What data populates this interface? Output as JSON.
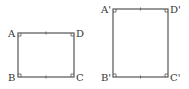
{
  "rect1": {
    "labels": {
      "A": "A",
      "B": "B",
      "C": "C",
      "D": "D"
    },
    "x": 18,
    "y": 33,
    "w": 56,
    "h": 44
  },
  "rect2": {
    "labels": {
      "A": "A'",
      "B": "B'",
      "C": "C'",
      "D": "D'"
    },
    "x": 113,
    "y": 9,
    "w": 55,
    "h": 68
  },
  "colors": {
    "stroke": "#444444"
  }
}
